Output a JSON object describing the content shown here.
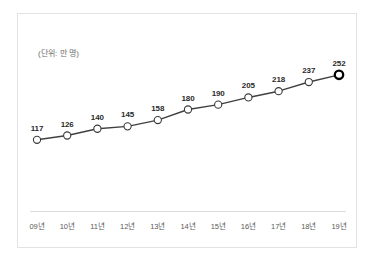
{
  "chart": {
    "unit_note": "(단위: 만 명)",
    "line_color": "#404040",
    "marker_fill": "#ffffff",
    "marker_stroke": "#3a3a3a",
    "last_marker_stroke": "#000000",
    "label_color": "#2b2b2b",
    "tick_color": "#5a5a5a",
    "frame_color": "#e3e3e3",
    "axis_color": "#dcdcdc"
  },
  "chart_data": {
    "type": "line",
    "title": "",
    "subtitle": "",
    "xlabel": "",
    "ylabel": "",
    "annotations": [
      "(단위: 만 명)"
    ],
    "grid": false,
    "legend": "none",
    "categories": [
      "09년",
      "10년",
      "11년",
      "12년",
      "13년",
      "14년",
      "15년",
      "16년",
      "17년",
      "18년",
      "19년"
    ],
    "values": [
      117,
      126,
      140,
      145,
      158,
      180,
      190,
      205,
      218,
      237,
      252
    ],
    "ylim": [
      100,
      262
    ],
    "series": [
      {
        "name": "",
        "values": [
          117,
          126,
          140,
          145,
          158,
          180,
          190,
          205,
          218,
          237,
          252
        ]
      }
    ],
    "points": [
      {
        "category": "09년",
        "value": 117,
        "label": "117"
      },
      {
        "category": "10년",
        "value": 126,
        "label": "126"
      },
      {
        "category": "11년",
        "value": 140,
        "label": "140"
      },
      {
        "category": "12년",
        "value": 145,
        "label": "145"
      },
      {
        "category": "13년",
        "value": 158,
        "label": "158"
      },
      {
        "category": "14년",
        "value": 180,
        "label": "180"
      },
      {
        "category": "15년",
        "value": 190,
        "label": "190"
      },
      {
        "category": "16년",
        "value": 205,
        "label": "205"
      },
      {
        "category": "17년",
        "value": 218,
        "label": "218"
      },
      {
        "category": "18년",
        "value": 237,
        "label": "237"
      },
      {
        "category": "19년",
        "value": 252,
        "label": "252"
      }
    ]
  }
}
